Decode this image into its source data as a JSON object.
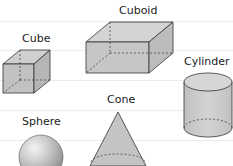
{
  "diagram": {
    "shapes": [
      {
        "name": "Cube",
        "label": "Cube"
      },
      {
        "name": "Cuboid",
        "label": "Cuboid"
      },
      {
        "name": "Cylinder",
        "label": "Cylinder"
      },
      {
        "name": "Cone",
        "label": "Cone"
      },
      {
        "name": "Sphere",
        "label": "Sphere"
      }
    ],
    "colors": {
      "fill": "#c8c8c8",
      "fill_dark": "#b4b4b4",
      "fill_light": "#dcdcdc",
      "stroke": "#333333",
      "ruled_line": "#ececec"
    }
  }
}
